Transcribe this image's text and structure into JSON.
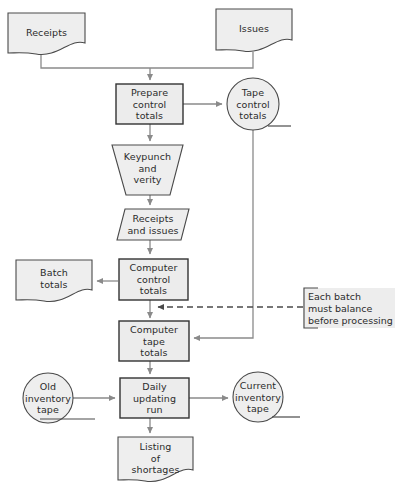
{
  "diagram": {
    "colors": {
      "shape_fill": "#eeeeee",
      "shape_stroke": "#4a4a4a",
      "connector": "#8a8a8a",
      "note_bg": "#ededed",
      "text": "#2b2b2b",
      "page_bg": "#ffffff"
    },
    "nodes": [
      {
        "id": "receipts",
        "label": "Receipts",
        "shape": "document"
      },
      {
        "id": "issues",
        "label": "Issues",
        "shape": "document"
      },
      {
        "id": "prepare_control",
        "label": "Prepare\ncontrol\ntotals",
        "shape": "process"
      },
      {
        "id": "tape_control",
        "label": "Tape\ncontrol\ntotals",
        "shape": "tape"
      },
      {
        "id": "keypunch",
        "label": "Keypunch\nand\nverity",
        "shape": "manual-operation"
      },
      {
        "id": "receipts_and_issues",
        "label": "Receipts\nand issues",
        "shape": "input-output"
      },
      {
        "id": "batch_totals",
        "label": "Batch\ntotals",
        "shape": "document"
      },
      {
        "id": "computer_control",
        "label": "Computer\ncontrol\ntotals",
        "shape": "process"
      },
      {
        "id": "computer_tape",
        "label": "Computer\ntape\ntotals",
        "shape": "process"
      },
      {
        "id": "old_inventory_tape",
        "label": "Old\ninventory\ntape",
        "shape": "tape"
      },
      {
        "id": "daily_updating_run",
        "label": "Daily\nupdating\nrun",
        "shape": "process"
      },
      {
        "id": "current_inventory_tape",
        "label": "Current\ninventory\ntape",
        "shape": "tape"
      },
      {
        "id": "listing_shortages",
        "label": "Listing\nof\nshortages",
        "shape": "document"
      }
    ],
    "annotation": {
      "id": "batch_balance_note",
      "label": "Each batch\nmust balance\nbefore processing",
      "connector": "dashed"
    }
  }
}
